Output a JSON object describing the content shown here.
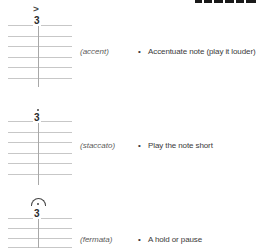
{
  "header": {
    "cropped_heading": {
      "color": "#1a1a1a"
    }
  },
  "rows": [
    {
      "note": "3",
      "symbol": "accent-mark",
      "accent_glyph": ">",
      "label": "(accent)",
      "bullet": "•",
      "text": "Accentuate note (play it louder)"
    },
    {
      "note": "3",
      "symbol": "staccato-dot",
      "label": "(staccato)",
      "bullet": "•",
      "text": "Play the note short"
    },
    {
      "note": "3",
      "symbol": "fermata",
      "label": "(fermata)",
      "bullet": "•",
      "text": "A hold or pause"
    }
  ],
  "colors": {
    "background": "#ffffff",
    "staff_line": "#c7c7c7",
    "stem": "#a8a8a8",
    "note": "#2a2a2a",
    "symbol": "#444444",
    "label": "#5a5a5a",
    "body_text": "#3a3a3a",
    "heading_fragment": "#1a1a1a"
  }
}
